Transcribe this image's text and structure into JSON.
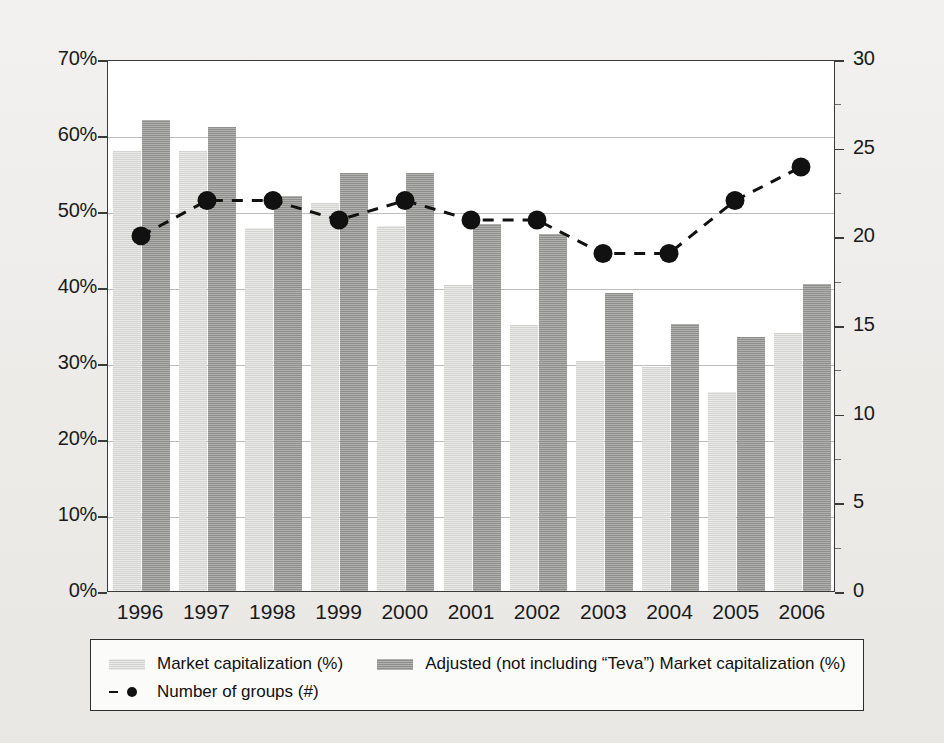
{
  "chart_data": {
    "type": "bar",
    "title": "",
    "xlabel": "",
    "ylabel": "",
    "categories": [
      "1996",
      "1997",
      "1998",
      "1999",
      "2000",
      "2001",
      "2002",
      "2003",
      "2004",
      "2005",
      "2006"
    ],
    "grid": true,
    "legend_position": "bottom",
    "left_axis": {
      "label": "",
      "ylim": [
        0,
        70
      ],
      "tick_step": 10,
      "tick_labels": [
        "0%",
        "10%",
        "20%",
        "30%",
        "40%",
        "50%",
        "60%",
        "70%"
      ],
      "tick_values": [
        0,
        10,
        20,
        30,
        40,
        50,
        60,
        70
      ],
      "unit": "%"
    },
    "right_axis": {
      "label": "",
      "ylim": [
        0,
        30
      ],
      "tick_step": 5,
      "tick_labels": [
        "0",
        "5",
        "10",
        "15",
        "20",
        "25",
        "30"
      ],
      "tick_values": [
        0,
        5,
        10,
        15,
        20,
        25,
        30
      ],
      "unit": "#"
    },
    "series": [
      {
        "name": "Market capitalization (%)",
        "type": "bar",
        "axis": "left",
        "color": "#d2d2ce",
        "values": [
          57.9,
          57.9,
          47.8,
          51.0,
          48.0,
          40.2,
          35.0,
          30.3,
          29.5,
          26.2,
          34.0
        ]
      },
      {
        "name": "Adjusted (not including “Teva”) Market capitalization (%)",
        "type": "bar",
        "axis": "left",
        "color": "#8e8e8c",
        "values": [
          62.0,
          61.0,
          52.0,
          55.0,
          55.0,
          48.3,
          47.0,
          39.2,
          35.1,
          33.4,
          40.4
        ]
      },
      {
        "name": "Number of groups (#)",
        "type": "line",
        "axis": "right",
        "color": "#111111",
        "marker": "circle",
        "linestyle": "dashed",
        "values": [
          20.1,
          22.1,
          22.1,
          21.0,
          22.1,
          21.0,
          21.0,
          19.1,
          19.1,
          22.1,
          24.0
        ]
      }
    ]
  },
  "legend": {
    "entries": [
      {
        "label": "Market capitalization (%)",
        "marker": "bar-light-swatch"
      },
      {
        "label": "Adjusted (not including “Teva”) Market capitalization (%)",
        "marker": "bar-dark-swatch"
      },
      {
        "label": "Number of groups (#)",
        "marker": "dashed-line-with-dot"
      }
    ]
  }
}
